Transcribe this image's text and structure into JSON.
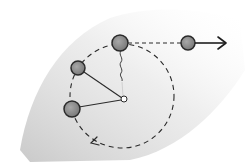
{
  "diagram": {
    "colors": {
      "background": "#ffffff",
      "shading": "#bdbdbd",
      "stroke": "#2a2a2a",
      "ball_fill": "#8e8e8e",
      "pivot_fill": "#ffffff"
    },
    "pivot": {
      "x": 124,
      "y": 99,
      "r": 3
    },
    "orbit": {
      "cx": 122,
      "cy": 96,
      "r": 52,
      "style": "dashed",
      "direction": "counterclockwise"
    },
    "balls": [
      {
        "id": "ball-top-released",
        "x": 120,
        "y": 43,
        "r": 8
      },
      {
        "id": "ball-upper-left",
        "x": 78,
        "y": 68,
        "r": 7
      },
      {
        "id": "ball-lower-left",
        "x": 72,
        "y": 109,
        "r": 8
      },
      {
        "id": "ball-flying",
        "x": 188,
        "y": 43,
        "r": 7
      }
    ],
    "strings": [
      {
        "from": "ball-upper-left",
        "to": "pivot",
        "state": "taut"
      },
      {
        "from": "ball-lower-left",
        "to": "pivot",
        "state": "taut"
      },
      {
        "from": "ball-top-released",
        "to": "pivot",
        "state": "broken"
      }
    ],
    "tangent_path": {
      "from": [
        128,
        43
      ],
      "to": [
        181,
        43
      ],
      "style": "dashed"
    },
    "velocity_arrow": {
      "from": [
        195,
        43
      ],
      "to": [
        226,
        43
      ]
    },
    "orbit_arrowhead": {
      "x": 92,
      "y": 143,
      "pointing": "up-left"
    }
  }
}
